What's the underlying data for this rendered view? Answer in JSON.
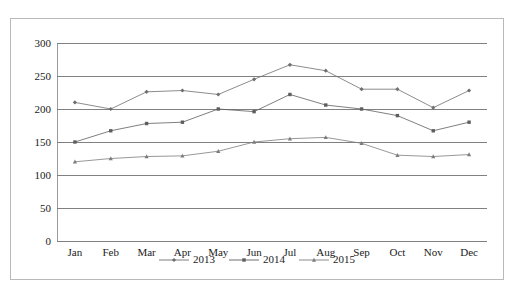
{
  "chart_data": {
    "type": "line",
    "title": "",
    "xlabel": "",
    "ylabel": "Number of Crimes",
    "categories": [
      "Jan",
      "Feb",
      "Mar",
      "Apr",
      "May",
      "Jun",
      "Jul",
      "Aug",
      "Sep",
      "Oct",
      "Nov",
      "Dec"
    ],
    "ylim": [
      0,
      300
    ],
    "yticks": [
      0,
      50,
      100,
      150,
      200,
      250,
      300
    ],
    "grid": true,
    "legend_position": "bottom",
    "series": [
      {
        "name": "2013",
        "marker": "diamond",
        "color": "#6f6f6f",
        "values": [
          210,
          200,
          226,
          228,
          222,
          245,
          267,
          258,
          230,
          230,
          202,
          228
        ]
      },
      {
        "name": "2014",
        "marker": "square",
        "color": "#5e5e5e",
        "values": [
          150,
          167,
          178,
          180,
          200,
          196,
          222,
          206,
          200,
          190,
          167,
          180
        ]
      },
      {
        "name": "2015",
        "marker": "triangle",
        "color": "#7d7d7d",
        "values": [
          120,
          125,
          128,
          129,
          136,
          150,
          155,
          157,
          148,
          130,
          128,
          131
        ]
      }
    ]
  },
  "axes": {
    "y_title": "Number of Crimes",
    "y_tick_labels": [
      "300",
      "250",
      "200",
      "150",
      "100",
      "50",
      "0"
    ],
    "x_tick_labels": [
      "Jan",
      "Feb",
      "Mar",
      "Apr",
      "May",
      "Jun",
      "Jul",
      "Aug",
      "Sep",
      "Oct",
      "Nov",
      "Dec"
    ]
  },
  "legend": {
    "items": [
      {
        "label": "2013",
        "marker": "diamond",
        "color": "#6f6f6f"
      },
      {
        "label": "2014",
        "marker": "square",
        "color": "#5e5e5e"
      },
      {
        "label": "2015",
        "marker": "triangle",
        "color": "#7d7d7d"
      }
    ]
  },
  "colors": {
    "grid": "#808080",
    "frame": "#b9b9b9",
    "text": "#1a1a1a",
    "background": "#ffffff"
  }
}
